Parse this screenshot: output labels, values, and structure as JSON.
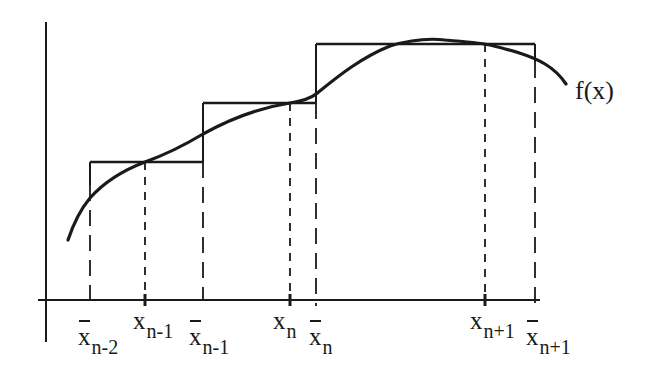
{
  "figure": {
    "function_label": "f(x)",
    "colors": {
      "ink": "#1a1a1a",
      "background": "#ffffff"
    },
    "axes": {
      "y_axis": {
        "x": 46,
        "y_top": 22,
        "y_bottom": 342
      },
      "x_axis": {
        "y": 300,
        "x_left": 38,
        "x_right": 540
      }
    },
    "steps": [
      {
        "left": 90,
        "right": 203,
        "top": 162
      },
      {
        "left": 203,
        "right": 316,
        "top": 103
      },
      {
        "left": 316,
        "right": 535,
        "top": 44
      }
    ],
    "interior_points": [
      {
        "x": 145,
        "y": 162
      },
      {
        "x": 290,
        "y": 103
      },
      {
        "x": 485,
        "y": 44
      }
    ],
    "curve_path": "M68,240 C74,222 80,210 90,198 C106,180 124,170 145,162 C170,153 188,143 203,134 C230,119 258,108 290,103 C302,101 310,99 316,94 C336,78 360,58 390,46 C410,40 428,38 445,40 C470,42 485,44 490,45 C510,50 530,55 545,64 C555,70 562,78 566,84",
    "labels": {
      "xbar_n_minus_2": {
        "base": "x",
        "sub": "n-2",
        "bar": true
      },
      "x_n_minus_1": {
        "base": "x",
        "sub": "n-1",
        "bar": false
      },
      "xbar_n_minus_1": {
        "base": "x",
        "sub": "n-1",
        "bar": true
      },
      "x_n": {
        "base": "x",
        "sub": "n",
        "bar": false
      },
      "xbar_n": {
        "base": "x",
        "sub": "n",
        "bar": true
      },
      "x_n_plus_1": {
        "base": "x",
        "sub": "n+1",
        "bar": false
      },
      "xbar_n_plus_1": {
        "base": "x",
        "sub": "n+1",
        "bar": true
      }
    }
  }
}
